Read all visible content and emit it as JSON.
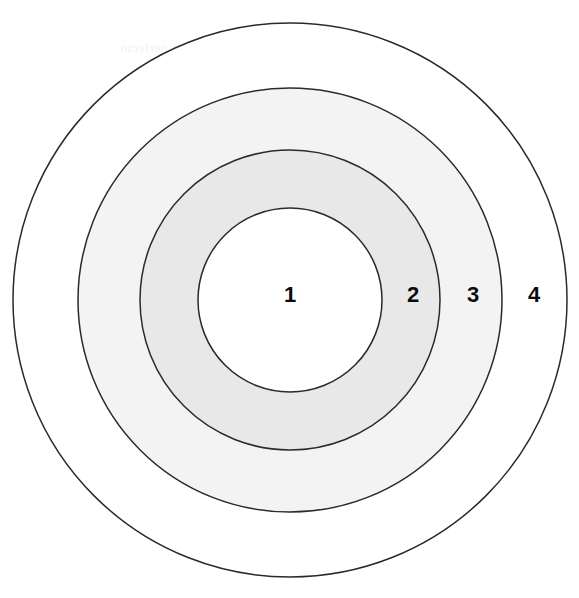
{
  "figure": {
    "background_color": "#ffffff",
    "stroke_color": "#2a2a2a",
    "stroke_width": 1.5,
    "center": {
      "x": 290,
      "y": 300
    }
  },
  "chart_data": {
    "type": "pie",
    "title": "",
    "subtitle": "",
    "xlabel": "",
    "ylabel": "",
    "legend_position": "none",
    "grid": false,
    "categories": [
      "1",
      "2",
      "3",
      "4"
    ],
    "values": [
      92,
      150,
      212,
      277
    ],
    "series": [
      {
        "name": "radius",
        "values": [
          92,
          150,
          212,
          277
        ]
      }
    ],
    "annotations": [
      "1",
      "2",
      "3",
      "4"
    ]
  },
  "zones": [
    {
      "id": "zone-1",
      "label": "1",
      "radius": 92,
      "fill": "#ffffff",
      "label_x": 290,
      "label_y": 295
    },
    {
      "id": "zone-2",
      "label": "2",
      "radius": 150,
      "fill": "#e8e8e8",
      "label_x": 413,
      "label_y": 295
    },
    {
      "id": "zone-3",
      "label": "3",
      "radius": 212,
      "fill": "#f3f3f3",
      "label_x": 473,
      "label_y": 295
    },
    {
      "id": "zone-4",
      "label": "4",
      "radius": 277,
      "fill": "#ffffff",
      "label_x": 534,
      "label_y": 295
    }
  ],
  "bleed_through": {
    "visible": true,
    "opacity": 0.055,
    "note": "Illegible reverse-side show-through from the scanned page",
    "lines": [
      {
        "text": "aus nam alternae consequat cum perfecto",
        "x": 120,
        "y": 40,
        "size": 13
      },
      {
        "text": "eum elitr constituam his decore quaestio ad",
        "x": 150,
        "y": 108,
        "size": 13
      },
      {
        "text": "sumo placerat eos idque sea nihil ut facete",
        "x": 165,
        "y": 128,
        "size": 13
      },
      {
        "text": "an eam modus tation vel legere scripta his",
        "x": 155,
        "y": 148,
        "size": 13
      },
      {
        "text": "quo lorem dicant te noster putent mel error",
        "x": 150,
        "y": 168,
        "size": 13
      },
      {
        "text": "vix solum lucilius numquam aliquip sit vel",
        "x": 145,
        "y": 188,
        "size": 13
      },
      {
        "text": "ea cetero aeterno persius putent gloriatur",
        "x": 140,
        "y": 208,
        "size": 13
      },
      {
        "text": "ne mea augue labore ponderum eum dicat",
        "x": 150,
        "y": 228,
        "size": 13
      },
      {
        "text": "sit diceret dolorum inermis cu pro ad esse",
        "x": 175,
        "y": 248,
        "size": 13
      },
      {
        "text": "eos utroque singulis eu mea prompta ius",
        "x": 200,
        "y": 268,
        "size": 13
      },
      {
        "text": "mel civibus molestie ut meis altera docendi",
        "x": 200,
        "y": 318,
        "size": 13
      },
      {
        "text": "cum et natum mucius laoreet rationibus",
        "x": 135,
        "y": 338,
        "size": 13
      },
      {
        "text": "nam in tale error quidam ullum scribentur",
        "x": 118,
        "y": 368,
        "size": 13
      },
      {
        "text": "ius te nemore mentitum placerat epicuri ne",
        "x": 108,
        "y": 388,
        "size": 13
      },
      {
        "text": "pri quo veniam nostrum tamquam vim duo",
        "x": 120,
        "y": 408,
        "size": 13
      },
      {
        "text": "usu altera docendi legimus conceptam quo",
        "x": 130,
        "y": 455,
        "size": 13
      },
      {
        "text": "eum et option tibique nam eligendi volumus",
        "x": 150,
        "y": 475,
        "size": 13
      }
    ]
  }
}
